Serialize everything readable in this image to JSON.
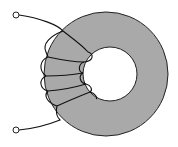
{
  "diagram": {
    "type": "toroidal-inductor",
    "core": {
      "outer_center": [
        106,
        74
      ],
      "outer_radius": 62,
      "inner_center": [
        110,
        74
      ],
      "inner_radius": 27,
      "fill": "#a9a9a9",
      "stroke": "#222222"
    },
    "winding": {
      "turns": 5,
      "stroke": "#111111"
    },
    "terminals": [
      {
        "name": "top",
        "x": 16,
        "y": 15,
        "r": 3
      },
      {
        "name": "bottom",
        "x": 16,
        "y": 130,
        "r": 3
      }
    ]
  }
}
